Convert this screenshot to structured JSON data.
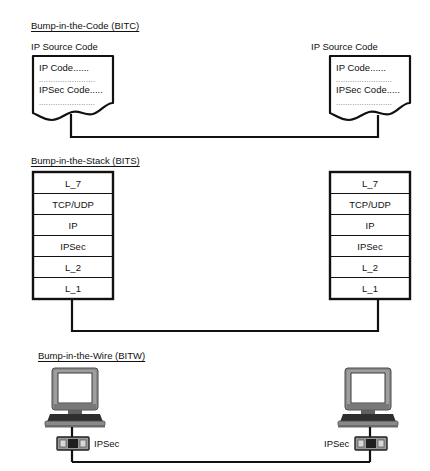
{
  "diagram": {
    "title_semantic": "IPSec implementation approaches: BITC, BITS, BITW",
    "sections": [
      {
        "id": "bitc",
        "heading": "Bump-in-the-Code (BITC)",
        "nodes": [
          {
            "side": "left",
            "caption": "IP Source Code",
            "lines": [
              "IP Code......",
              "IPSec Code....."
            ],
            "dot_rows": [
              "........................",
              "........................"
            ]
          },
          {
            "side": "right",
            "caption": "IP Source Code",
            "lines": [
              "IP Code......",
              "IPSec Code....."
            ],
            "dot_rows": [
              "........................",
              "........................"
            ]
          }
        ]
      },
      {
        "id": "bits",
        "heading": "Bump-in-the-Stack (BITS)",
        "stack_layers": [
          "L_7",
          "TCP/UDP",
          "IP",
          "IPSec",
          "L_2",
          "L_1"
        ],
        "nodes": [
          {
            "side": "left",
            "layers": [
              "L_7",
              "TCP/UDP",
              "IP",
              "IPSec",
              "L_2",
              "L_1"
            ]
          },
          {
            "side": "right",
            "layers": [
              "L_7",
              "TCP/UDP",
              "IP",
              "IPSec",
              "L_2",
              "L_1"
            ]
          }
        ]
      },
      {
        "id": "bitw",
        "heading": "Bump-in-the-Wire (BITW)",
        "nodes": [
          {
            "side": "left",
            "device_icon": "computer-icon",
            "box_icon": "network-device-icon",
            "box_label": "IPSec",
            "label_position": "right"
          },
          {
            "side": "right",
            "device_icon": "computer-icon",
            "box_icon": "network-device-icon",
            "box_label": "IPSec",
            "label_position": "left"
          }
        ]
      }
    ],
    "colors": {
      "line": "#111111",
      "text": "#111111",
      "page_background": "#ffffff",
      "monitor_bezel": "#8a8a8a",
      "monitor_bezel_dark": "#5f5f5f",
      "monitor_screen": "#ffffff",
      "keyboard_dark": "#2e2e2e",
      "keyboard_mid": "#7d7d7d",
      "device_gray": "#9a9a9a",
      "device_dark": "#1f1f1f",
      "dot_text": "#555555"
    }
  }
}
